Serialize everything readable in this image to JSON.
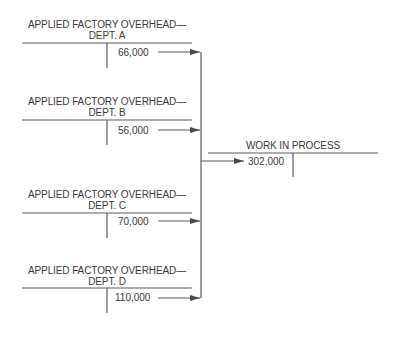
{
  "accounts": [
    {
      "title_line1": "APPLIED FACTORY OVERHEAD—",
      "title_line2": "DEPT. A",
      "credit": "66,000"
    },
    {
      "title_line1": "APPLIED FACTORY OVERHEAD—",
      "title_line2": "DEPT. B",
      "credit": "56,000"
    },
    {
      "title_line1": "APPLIED FACTORY OVERHEAD—",
      "title_line2": "DEPT. C",
      "credit": "70,000"
    },
    {
      "title_line1": "APPLIED FACTORY OVERHEAD—",
      "title_line2": "DEPT. D",
      "credit": "110,000"
    }
  ],
  "work_in_process": {
    "title": "WORK IN PROCESS",
    "debit": "302,000"
  },
  "colors": {
    "line": "#5a5a5a",
    "text": "#3a3a3a"
  }
}
